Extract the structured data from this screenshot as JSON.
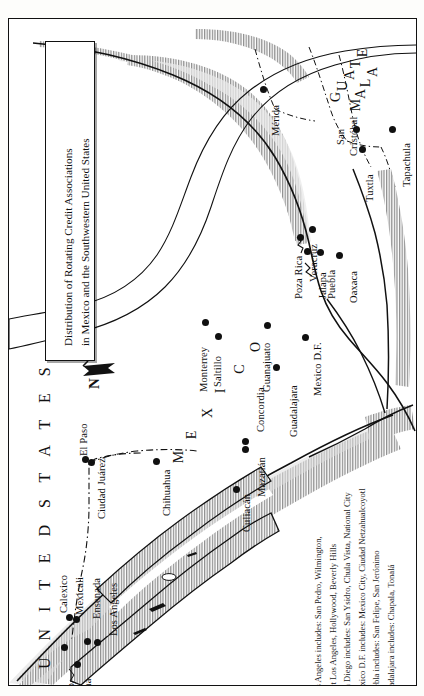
{
  "document": {
    "type": "map",
    "orientation": "rotated-90-ccw",
    "title_line1": "Distribution of Rotating Credit Associations",
    "title_line2": "in Mexico and the Southwestern United States"
  },
  "compass": {
    "north_label": "N"
  },
  "regions": {
    "united_states": "U N I T E D   S T A T E S",
    "mexico": "M E X I C O",
    "guatemala_line1": "G U A T E",
    "guatemala_line2": "M A L A"
  },
  "country_letters": {
    "mexico_letters": [
      "M",
      "E",
      "X",
      "I",
      "C",
      "O"
    ],
    "guatemala_letters_1": [
      "G",
      "U",
      "A",
      "T",
      "E"
    ],
    "guatemala_letters_2": [
      "M",
      "A",
      "L",
      "A"
    ]
  },
  "cities": [
    {
      "name": "Los Angeles",
      "dot_x": 88,
      "dot_y": 623,
      "lab_x": 100,
      "lab_y": 617
    },
    {
      "name": "San",
      "dot_x": 0,
      "dot_y": 0,
      "lab_x": 40,
      "lab_y": 688
    },
    {
      "name": "Diego",
      "dot_x": 55,
      "dot_y": 628,
      "lab_x": 57,
      "lab_y": 690
    },
    {
      "name": "Tijuana",
      "dot_x": 68,
      "dot_y": 645,
      "lab_x": 74,
      "lab_y": 692
    },
    {
      "name": "Calexico",
      "dot_x": 60,
      "dot_y": 598,
      "lab_x": 50,
      "lab_y": 594
    },
    {
      "name": "Mexicali",
      "dot_x": 67,
      "dot_y": 600,
      "lab_x": 66,
      "lab_y": 596
    },
    {
      "name": "Ensenada",
      "dot_x": 78,
      "dot_y": 622,
      "lab_x": 83,
      "lab_y": 600
    },
    {
      "name": "El Paso",
      "dot_x": 76,
      "dot_y": 440,
      "lab_x": 70,
      "lab_y": 437
    },
    {
      "name": "Ciudad Juárez",
      "dot_x": 82,
      "dot_y": 443,
      "lab_x": 88,
      "lab_y": 500
    },
    {
      "name": "Chihuahua",
      "dot_x": 147,
      "dot_y": 442,
      "lab_x": 153,
      "lab_y": 497
    },
    {
      "name": "Culiacán",
      "dot_x": 227,
      "dot_y": 470,
      "lab_x": 233,
      "lab_y": 513
    },
    {
      "name": "Mazatlán",
      "dot_x": 236,
      "dot_y": 430,
      "lab_x": 248,
      "lab_y": 478
    },
    {
      "name": "Concordia",
      "dot_x": 236,
      "dot_y": 422,
      "lab_x": 247,
      "lab_y": 413
    },
    {
      "name": "Monterrey",
      "dot_x": 196,
      "dot_y": 303,
      "lab_x": 190,
      "lab_y": 373
    },
    {
      "name": "Saltillo",
      "dot_x": 209,
      "dot_y": 317,
      "lab_x": 204,
      "lab_y": 368
    },
    {
      "name": "Guanajuato",
      "dot_x": 258,
      "dot_y": 306,
      "lab_x": 253,
      "lab_y": 373
    },
    {
      "name": "Guadalajara",
      "dot_x": 267,
      "dot_y": 348,
      "lab_x": 280,
      "lab_y": 418
    },
    {
      "name": "Mexico D.F.",
      "dot_x": 296,
      "dot_y": 318,
      "lab_x": 304,
      "lab_y": 377
    },
    {
      "name": "Poza Rica",
      "dot_x": 291,
      "dot_y": 218,
      "lab_x": 285,
      "lab_y": 280
    },
    {
      "name": "Veracruz",
      "dot_x": 303,
      "dot_y": 210,
      "lab_x": 300,
      "lab_y": 263
    },
    {
      "name": "Jalapa",
      "dot_x": 298,
      "dot_y": 232,
      "lab_x": 309,
      "lab_y": 280
    },
    {
      "name": "Puebla",
      "dot_x": 311,
      "dot_y": 233,
      "lab_x": 318,
      "lab_y": 280
    },
    {
      "name": "Oaxaca",
      "dot_x": 330,
      "dot_y": 236,
      "lab_x": 340,
      "lab_y": 284
    },
    {
      "name": "Mérida",
      "dot_x": 254,
      "dot_y": 70,
      "lab_x": 262,
      "lab_y": 117
    },
    {
      "name": "San",
      "dot_x": 0,
      "dot_y": 0,
      "lab_x": 327,
      "lab_y": 126
    },
    {
      "name": "Cristóbal",
      "dot_x": 347,
      "dot_y": 110,
      "lab_x": 340,
      "lab_y": 137
    },
    {
      "name": "Tuxtla",
      "dot_x": 353,
      "dot_y": 130,
      "lab_x": 356,
      "lab_y": 183
    },
    {
      "name": "Tapachula",
      "dot_x": 383,
      "dot_y": 110,
      "lab_x": 393,
      "lab_y": 168
    }
  ],
  "legend": {
    "lines": [
      "Los Angeles includes: San Pedro, Wilmington,",
      "East Los Angeles, Hollywood, Beverly Hills",
      "San Diego includes: San Ysidro, Chula Vista, National City",
      "Mexico D.F. includes: Mexico City, Ciudad Netzahualcoyotl",
      "Puebla includes: San Felipe, San Jerónimo",
      "Guadalajara includes: Chapala, Tonalá"
    ]
  },
  "colors": {
    "ink": "#111111",
    "paper": "#ffffff",
    "page": "#fdfdfb",
    "hatch": "#9a9a9a",
    "coast_shade": "#c9c9c9"
  }
}
